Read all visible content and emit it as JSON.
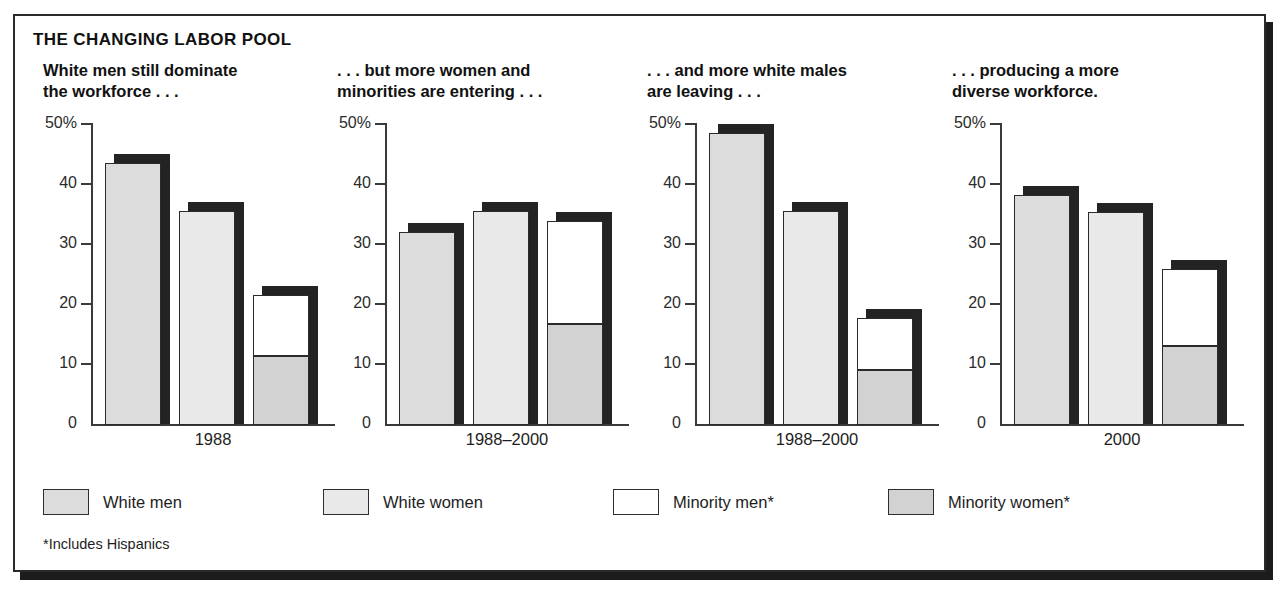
{
  "title": "THE CHANGING LABOR POOL",
  "footnote": "*Includes Hispanics",
  "legend": [
    {
      "label": "White men",
      "color": "#dcdcdc",
      "key": "white_men"
    },
    {
      "label": "White women",
      "color": "#e9e9e9",
      "key": "white_women"
    },
    {
      "label": "Minority men*",
      "color": "#ffffff",
      "key": "minority_men"
    },
    {
      "label": "Minority women*",
      "color": "#d2d2d2",
      "key": "minority_women"
    }
  ],
  "panels": [
    {
      "heading": "White men still dominate\nthe workforce . . .",
      "xlabel": "1988"
    },
    {
      "heading": ". . . but more women and\nminorities are entering . . .",
      "xlabel": "1988–2000"
    },
    {
      "heading": ". . . and more white males\nare leaving . . .",
      "xlabel": "1988–2000"
    },
    {
      "heading": ". . . producing a more\ndiverse workforce.",
      "xlabel": "2000"
    }
  ],
  "yticks": [
    "50%",
    "40",
    "30",
    "20",
    "10",
    "0"
  ],
  "chart_data": {
    "type": "bar",
    "title": "THE CHANGING LABOR POOL",
    "xlabel": "",
    "ylabel": "",
    "ylim": [
      0,
      50
    ],
    "ytick_values": [
      0,
      10,
      20,
      30,
      40,
      50
    ],
    "ytick_labels": [
      "0",
      "10",
      "20",
      "30",
      "40",
      "50%"
    ],
    "grid": false,
    "legend_position": "bottom",
    "units": "percent",
    "note": "Third bar of each panel is stacked: minority women (bottom) + minority men (top).",
    "panels": [
      {
        "title": "White men still dominate the workforce . . .",
        "category": "1988",
        "bars": [
          {
            "name": "White men",
            "value": 43.5,
            "stacked": false
          },
          {
            "name": "White women",
            "value": 35.5,
            "stacked": false
          },
          {
            "name": "Minority men + Minority women",
            "stacked": true,
            "total": 21.5,
            "segments": [
              {
                "name": "Minority women*",
                "value": 11.3
              },
              {
                "name": "Minority men*",
                "value": 10.2
              }
            ]
          }
        ]
      },
      {
        "title": ". . . but more women and minorities are entering . . .",
        "category": "1988–2000",
        "bars": [
          {
            "name": "White men",
            "value": 32.0,
            "stacked": false
          },
          {
            "name": "White women",
            "value": 35.5,
            "stacked": false
          },
          {
            "name": "Minority men + Minority women",
            "stacked": true,
            "total": 33.8,
            "segments": [
              {
                "name": "Minority women*",
                "value": 16.7
              },
              {
                "name": "Minority men*",
                "value": 17.1
              }
            ]
          }
        ]
      },
      {
        "title": ". . . and more white males are leaving . . .",
        "category": "1988–2000",
        "bars": [
          {
            "name": "White men",
            "value": 48.5,
            "stacked": false
          },
          {
            "name": "White women",
            "value": 35.5,
            "stacked": false
          },
          {
            "name": "Minority men + Minority women",
            "stacked": true,
            "total": 17.6,
            "segments": [
              {
                "name": "Minority women*",
                "value": 9.0
              },
              {
                "name": "Minority men*",
                "value": 8.6
              }
            ]
          }
        ]
      },
      {
        "title": ". . . producing a more diverse workforce.",
        "category": "2000",
        "bars": [
          {
            "name": "White men",
            "value": 38.2,
            "stacked": false
          },
          {
            "name": "White women",
            "value": 35.3,
            "stacked": false
          },
          {
            "name": "Minority men + Minority women",
            "stacked": true,
            "total": 25.8,
            "segments": [
              {
                "name": "Minority women*",
                "value": 13.0
              },
              {
                "name": "Minority men*",
                "value": 12.8
              }
            ]
          }
        ]
      }
    ]
  }
}
